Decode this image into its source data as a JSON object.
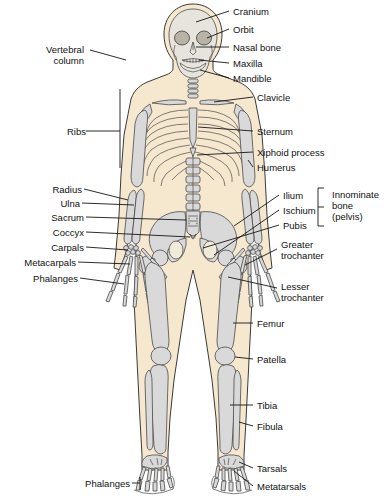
{
  "figure": {
    "colors": {
      "background": "#ffffff",
      "body_fill": "#f6e7cf",
      "bone_fill": "#d9d9d9",
      "bone_light": "#e8e6e0",
      "outline": "#2b2b2b",
      "leader_line": "#1a1a1a",
      "text": "#111111"
    }
  },
  "labels_left": [
    {
      "id": "vertebral-column",
      "text": "Vertebral\ncolumn",
      "x": 28,
      "y": 44
    },
    {
      "id": "ribs",
      "text": "Ribs",
      "x": 56,
      "y": 126
    },
    {
      "id": "radius",
      "text": "Radius",
      "x": 44,
      "y": 184
    },
    {
      "id": "ulna",
      "text": "Ulna",
      "x": 56,
      "y": 198
    },
    {
      "id": "sacrum",
      "text": "Sacrum",
      "x": 40,
      "y": 212
    },
    {
      "id": "coccyx",
      "text": "Coccyx",
      "x": 42,
      "y": 227
    },
    {
      "id": "carpals",
      "text": "Carpals",
      "x": 41,
      "y": 242
    },
    {
      "id": "metacarpals",
      "text": "Metacarpals",
      "x": 10,
      "y": 257
    },
    {
      "id": "phalanges-hand",
      "text": "Phalanges",
      "x": 22,
      "y": 273
    },
    {
      "id": "phalanges-foot",
      "text": "Phalanges",
      "x": 75,
      "y": 478
    }
  ],
  "labels_right": [
    {
      "id": "cranium",
      "text": "Cranium",
      "x": 233,
      "y": 6
    },
    {
      "id": "orbit",
      "text": "Orbit",
      "x": 233,
      "y": 24
    },
    {
      "id": "nasal-bone",
      "text": "Nasal bone",
      "x": 233,
      "y": 42
    },
    {
      "id": "maxilla",
      "text": "Maxilla",
      "x": 233,
      "y": 58
    },
    {
      "id": "mandible",
      "text": "Mandible",
      "x": 233,
      "y": 73
    },
    {
      "id": "clavicle",
      "text": "Clavicle",
      "x": 257,
      "y": 92
    },
    {
      "id": "sternum",
      "text": "Sternum",
      "x": 257,
      "y": 126
    },
    {
      "id": "xiphoid-process",
      "text": "Xiphoid process",
      "x": 257,
      "y": 147
    },
    {
      "id": "humerus",
      "text": "Humerus",
      "x": 257,
      "y": 162
    },
    {
      "id": "ilium",
      "text": "Ilium",
      "x": 283,
      "y": 190
    },
    {
      "id": "ischium",
      "text": "Ischium",
      "x": 283,
      "y": 205
    },
    {
      "id": "pubis",
      "text": "Pubis",
      "x": 283,
      "y": 220
    },
    {
      "id": "innominate-bone",
      "text": "Innominate\nbone\n(pelvis)",
      "x": 332,
      "y": 190
    },
    {
      "id": "greater-trochanter",
      "text": "Greater\ntrochanter",
      "x": 281,
      "y": 239
    },
    {
      "id": "lesser-trochanter",
      "text": "Lesser\ntrochanter",
      "x": 281,
      "y": 281
    },
    {
      "id": "femur",
      "text": "Femur",
      "x": 257,
      "y": 318
    },
    {
      "id": "patella",
      "text": "Patella",
      "x": 257,
      "y": 354
    },
    {
      "id": "tibia",
      "text": "Tibia",
      "x": 257,
      "y": 400
    },
    {
      "id": "fibula",
      "text": "Fibula",
      "x": 257,
      "y": 421
    },
    {
      "id": "tarsals",
      "text": "Tarsals",
      "x": 257,
      "y": 463
    },
    {
      "id": "metatarsals",
      "text": "Metatarsals",
      "x": 257,
      "y": 481
    }
  ],
  "bones_depicted": [
    "cranium",
    "orbit",
    "nasal bone",
    "maxilla",
    "mandible",
    "cervical vertebrae",
    "clavicle",
    "scapula",
    "sternum",
    "ribs",
    "xiphoid process",
    "humerus",
    "vertebral column",
    "radius",
    "ulna",
    "carpals",
    "metacarpals",
    "phalanges (hand)",
    "ilium",
    "sacrum",
    "coccyx",
    "ischium",
    "pubis",
    "greater trochanter",
    "lesser trochanter",
    "femur",
    "patella",
    "tibia",
    "fibula",
    "tarsals",
    "metatarsals",
    "phalanges (foot)"
  ]
}
